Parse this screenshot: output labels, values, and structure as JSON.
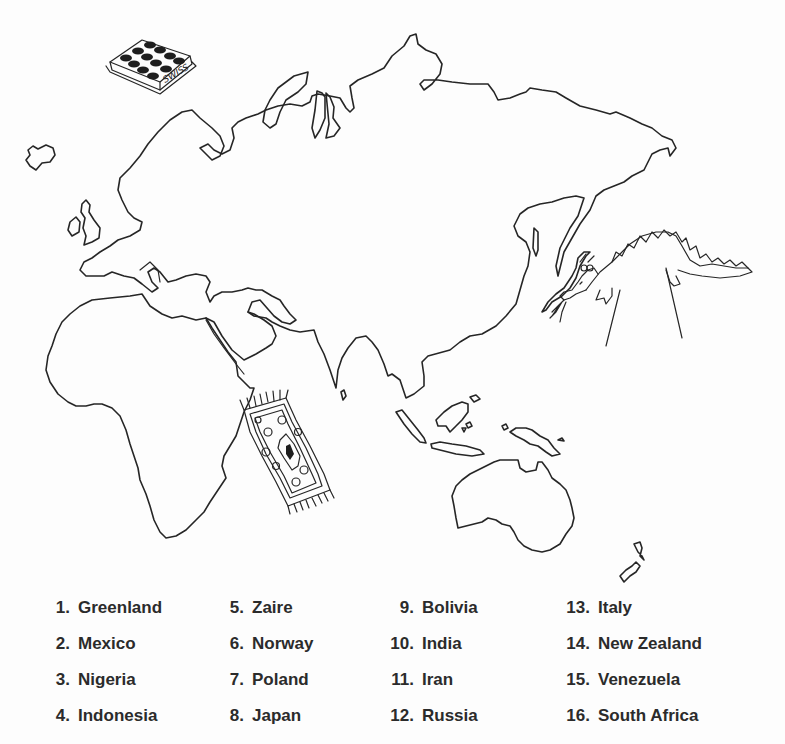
{
  "worksheet": {
    "map": {
      "region": "Eastern Hemisphere outline map",
      "illustrations": [
        {
          "name": "swiss-chocolate-box",
          "label": "SWISS"
        },
        {
          "name": "dragon"
        },
        {
          "name": "flying-carpet"
        }
      ]
    },
    "countries": [
      {
        "number": "1.",
        "name": "Greenland"
      },
      {
        "number": "2.",
        "name": "Mexico"
      },
      {
        "number": "3.",
        "name": "Nigeria"
      },
      {
        "number": "4.",
        "name": "Indonesia"
      },
      {
        "number": "5.",
        "name": "Zaire"
      },
      {
        "number": "6.",
        "name": "Norway"
      },
      {
        "number": "7.",
        "name": "Poland"
      },
      {
        "number": "8.",
        "name": "Japan"
      },
      {
        "number": "9.",
        "name": "Bolivia"
      },
      {
        "number": "10.",
        "name": "India"
      },
      {
        "number": "11.",
        "name": "Iran"
      },
      {
        "number": "12.",
        "name": "Russia"
      },
      {
        "number": "13.",
        "name": "Italy"
      },
      {
        "number": "14.",
        "name": "New Zealand"
      },
      {
        "number": "15.",
        "name": "Venezuela"
      },
      {
        "number": "16.",
        "name": "South Africa"
      }
    ]
  }
}
